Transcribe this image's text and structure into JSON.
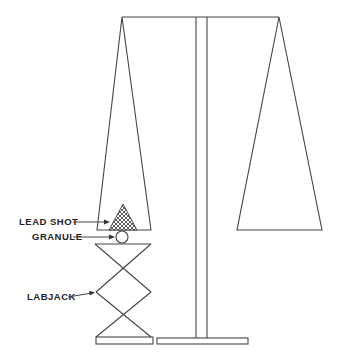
{
  "diagram": {
    "type": "balance-scale-apparatus",
    "labels": {
      "lead_shot": "LEAD SHOT",
      "granule": "GRANULE",
      "labjack": "LABJACK"
    },
    "colors": {
      "line": "#444444",
      "text": "#222222",
      "background": "#ffffff"
    }
  }
}
